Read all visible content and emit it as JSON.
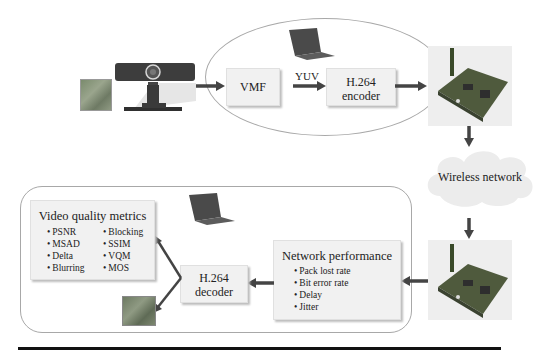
{
  "top_flow": {
    "vmf_label": "VMF",
    "yuv_label": "YUV",
    "encoder_line1": "H.264",
    "encoder_line2": "encoder"
  },
  "network": {
    "cloud_label": "Wireless network"
  },
  "bottom_flow": {
    "decoder_line1": "H.264",
    "decoder_line2": "decoder",
    "network_performance": {
      "title": "Network performance",
      "items": [
        "Pack lost rate",
        "Bit error rate",
        "Delay",
        "Jitter"
      ]
    },
    "video_quality_metrics": {
      "title": "Video quality metrics",
      "col1": [
        "PSNR",
        "MSAD",
        "Delta",
        "Blurring"
      ],
      "col2": [
        "Blocking",
        "SSIM",
        "VQM",
        "MOS"
      ]
    }
  },
  "icons": {
    "source_image": "video-frame-thumbnail",
    "camera": "webcam-icon",
    "laptop_top": "laptop-icon",
    "board_top": "wireless-board-icon",
    "board_bottom": "wireless-board-icon",
    "laptop_bottom": "laptop-icon",
    "output_image": "video-frame-thumbnail"
  },
  "colors": {
    "box_fill": "#f1f1f1",
    "arrow": "#444444",
    "frame_stroke": "#a8a8a8",
    "cloud_fill": "#ececec"
  }
}
